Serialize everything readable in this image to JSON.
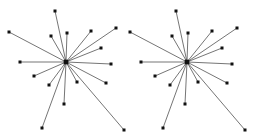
{
  "figure": {
    "type": "node-link-diagram",
    "background_color": "#ffffff",
    "edge_color": "#3a3a3a",
    "node_color": "#111111",
    "width": 253,
    "height": 136
  },
  "chart_data": {
    "type": "scatter",
    "title": "",
    "xlabel": "",
    "ylabel": "",
    "grid": false,
    "legend": null,
    "xlim": [
      0,
      253
    ],
    "ylim": [
      0,
      136
    ],
    "graphs": [
      {
        "name": "left-star-graph",
        "hub": {
          "label": "hub-left",
          "x": 66,
          "y": 62,
          "size": 4.6
        },
        "leaves": [
          {
            "label": "L1",
            "x": 9,
            "y": 32,
            "size": 3.0
          },
          {
            "label": "L2",
            "x": 55,
            "y": 11,
            "size": 3.0
          },
          {
            "label": "L3",
            "x": 51,
            "y": 36,
            "size": 3.0
          },
          {
            "label": "L4",
            "x": 67,
            "y": 33,
            "size": 3.0
          },
          {
            "label": "L5",
            "x": 91,
            "y": 31,
            "size": 3.0
          },
          {
            "label": "L6",
            "x": 116,
            "y": 28,
            "size": 3.0
          },
          {
            "label": "L7",
            "x": 101,
            "y": 48,
            "size": 3.0
          },
          {
            "label": "L8",
            "x": 111,
            "y": 64,
            "size": 3.0
          },
          {
            "label": "L9",
            "x": 20,
            "y": 62,
            "size": 3.0
          },
          {
            "label": "L10",
            "x": 34,
            "y": 76,
            "size": 3.0
          },
          {
            "label": "L11",
            "x": 49,
            "y": 85,
            "size": 3.0
          },
          {
            "label": "L12",
            "x": 64,
            "y": 104,
            "size": 3.0
          },
          {
            "label": "L13",
            "x": 42,
            "y": 128,
            "size": 3.0
          },
          {
            "label": "L14",
            "x": 77,
            "y": 82,
            "size": 3.0
          },
          {
            "label": "L15",
            "x": 106,
            "y": 83,
            "size": 3.0
          },
          {
            "label": "L16",
            "x": 124,
            "y": 130,
            "size": 3.0
          }
        ]
      },
      {
        "name": "right-star-graph",
        "hub": {
          "label": "hub-right",
          "x": 187,
          "y": 62,
          "size": 4.6
        },
        "leaves": [
          {
            "label": "R1",
            "x": 130,
            "y": 32,
            "size": 3.0
          },
          {
            "label": "R2",
            "x": 176,
            "y": 11,
            "size": 3.0
          },
          {
            "label": "R3",
            "x": 172,
            "y": 36,
            "size": 3.0
          },
          {
            "label": "R4",
            "x": 188,
            "y": 33,
            "size": 3.0
          },
          {
            "label": "R5",
            "x": 212,
            "y": 31,
            "size": 3.0
          },
          {
            "label": "R6",
            "x": 237,
            "y": 28,
            "size": 3.0
          },
          {
            "label": "R7",
            "x": 222,
            "y": 48,
            "size": 3.0
          },
          {
            "label": "R8",
            "x": 232,
            "y": 64,
            "size": 3.0
          },
          {
            "label": "R9",
            "x": 141,
            "y": 62,
            "size": 3.0
          },
          {
            "label": "R10",
            "x": 155,
            "y": 76,
            "size": 3.0
          },
          {
            "label": "R11",
            "x": 170,
            "y": 85,
            "size": 3.0
          },
          {
            "label": "R12",
            "x": 185,
            "y": 104,
            "size": 3.0
          },
          {
            "label": "R13",
            "x": 163,
            "y": 128,
            "size": 3.0
          },
          {
            "label": "R14",
            "x": 198,
            "y": 82,
            "size": 3.0
          },
          {
            "label": "R15",
            "x": 227,
            "y": 83,
            "size": 3.0
          },
          {
            "label": "R16",
            "x": 245,
            "y": 130,
            "size": 3.0
          }
        ]
      }
    ]
  }
}
